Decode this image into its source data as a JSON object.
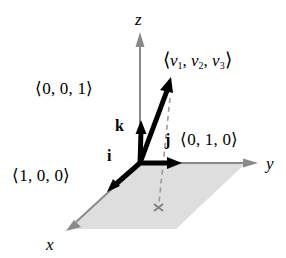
{
  "figure": {
    "background_color": "#ffffff",
    "width": 286,
    "height": 258
  },
  "colors": {
    "axis": "#8a8a8a",
    "vector": "#000000",
    "plane_fill": "#dcdcdc",
    "dashed": "#9a9a9a",
    "text": "#000000"
  },
  "axes": [
    {
      "name": "z-axis",
      "label": "z",
      "direction": "up"
    },
    {
      "name": "y-axis",
      "label": "y",
      "direction": "right"
    },
    {
      "name": "x-axis",
      "label": "x",
      "direction": "down-left"
    }
  ],
  "axis_labels": {
    "x": "x",
    "y": "y",
    "z": "z"
  },
  "unit_vectors": [
    {
      "name": "i",
      "symbol": "i",
      "components": "⟨1, 0, 0⟩",
      "axis": "x"
    },
    {
      "name": "j",
      "symbol": "j",
      "components": "⟨0, 1, 0⟩",
      "axis": "y"
    },
    {
      "name": "k",
      "symbol": "k",
      "components": "⟨0, 0, 1⟩",
      "axis": "z"
    }
  ],
  "vector": {
    "name": "v",
    "open_bracket": "⟨",
    "close_bracket": "⟩",
    "symbol": "v",
    "sub1": "1",
    "sub2": "2",
    "sub3": "3",
    "comma": ",",
    "label_text": "⟨v₁, v₂, v₃⟩"
  },
  "plane": {
    "name": "xy-plane",
    "shaded": true
  },
  "projection": {
    "name": "projection-marker",
    "marker": "×",
    "dashed_line": true
  }
}
